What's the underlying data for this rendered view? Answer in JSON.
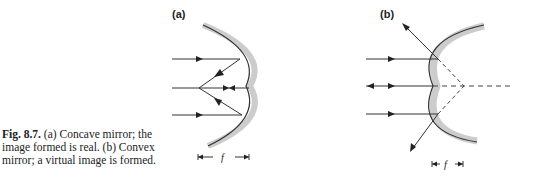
{
  "caption": {
    "figure_number": "Fig. 8.7.",
    "text": " (a) Concave mirror; the image formed is real. (b) Convex mirror; a virtual image is formed."
  },
  "panels": [
    {
      "label": "(a)",
      "type": "concave-mirror",
      "dimension_label": "f",
      "image": "real"
    },
    {
      "label": "(b)",
      "type": "convex-mirror",
      "dimension_label": "f",
      "image": "virtual"
    }
  ]
}
